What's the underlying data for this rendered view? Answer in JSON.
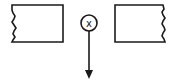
{
  "diagram": {
    "left_block": {
      "shape": "rectangle-broken-left-edge"
    },
    "right_block": {
      "shape": "rectangle-broken-right-edge"
    },
    "conductor": {
      "symbol": "x",
      "meaning": "current-into-page"
    },
    "force_arrow": {
      "direction": "down"
    },
    "colors": {
      "stroke": "#1a1a1a",
      "background": "#ffffff"
    }
  }
}
